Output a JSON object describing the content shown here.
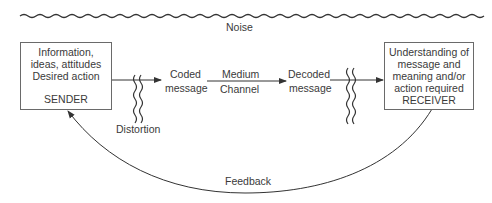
{
  "diagram": {
    "type": "communication-process-model",
    "noise": {
      "label": "Noise"
    },
    "sender": {
      "lines": [
        "Information,",
        "ideas, attitudes",
        "Desired action"
      ],
      "role": "SENDER"
    },
    "distortion": {
      "label": "Distortion"
    },
    "coded_message": {
      "line1": "Coded",
      "line2": "message"
    },
    "channel": {
      "line1": "Medium",
      "line2": "Channel"
    },
    "decoded_message": {
      "line1": "Decoded",
      "line2": "message"
    },
    "receiver": {
      "lines": [
        "Understanding of",
        "message and",
        "meaning and/or",
        "action required"
      ],
      "role": "RECEIVER"
    },
    "feedback": {
      "label": "Feedback"
    },
    "colors": {
      "line": "#333333",
      "box_border": "#6a6a6a",
      "text": "#3a3a3a"
    }
  }
}
